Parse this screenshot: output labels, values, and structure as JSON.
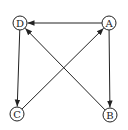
{
  "diagram": {
    "type": "directed-graph",
    "nodes": [
      {
        "id": "A",
        "label": "A",
        "x": 109,
        "y": 23
      },
      {
        "id": "B",
        "label": "B",
        "x": 110,
        "y": 115
      },
      {
        "id": "C",
        "label": "C",
        "x": 17,
        "y": 114
      },
      {
        "id": "D",
        "label": "D",
        "x": 20,
        "y": 23
      }
    ],
    "edges": [
      {
        "from": "A",
        "to": "D"
      },
      {
        "from": "A",
        "to": "B"
      },
      {
        "from": "B",
        "to": "D"
      },
      {
        "from": "D",
        "to": "C"
      },
      {
        "from": "C",
        "to": "A"
      }
    ],
    "node_radius": 7,
    "colors": {
      "stroke": "#222222",
      "background": "#ffffff"
    }
  }
}
